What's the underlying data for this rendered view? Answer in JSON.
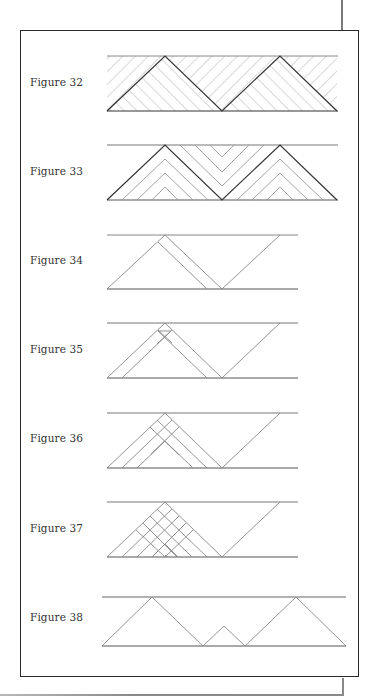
{
  "figures": [
    {
      "label": "Figure 32",
      "label_y": 76
    },
    {
      "label": "Figure 33",
      "label_y": 165
    },
    {
      "label": "Figure 34",
      "label_y": 254
    },
    {
      "label": "Figure 35",
      "label_y": 343
    },
    {
      "label": "Figure 36",
      "label_y": 432
    },
    {
      "label": "Figure 37",
      "label_y": 522
    },
    {
      "label": "Figure 38",
      "label_y": 611
    }
  ],
  "colors": {
    "frame": "#2a2a2a",
    "line_dark": "#333333",
    "line_light": "#9a9a9a",
    "text": "#333333"
  }
}
